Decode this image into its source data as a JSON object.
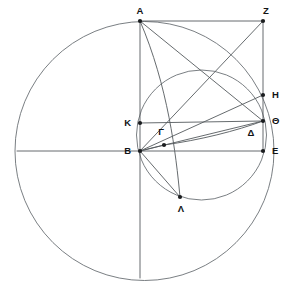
{
  "figure": {
    "background_color": "#ffffff",
    "line_color": "#555a5e",
    "circle_color": "#6b7075",
    "label_color": "#111315",
    "dot_color": "#1b1d1f",
    "width": 289,
    "height": 288
  },
  "points": [
    {
      "label": "A",
      "x": 140,
      "y": 21,
      "label_x": 140,
      "label_y": 11,
      "anchor": "middle",
      "dot": true
    },
    {
      "label": "Z",
      "x": 263,
      "y": 21,
      "label_x": 266,
      "label_y": 11,
      "anchor": "middle",
      "dot": true
    },
    {
      "label": "H",
      "x": 263,
      "y": 95,
      "label_x": 272,
      "label_y": 95,
      "anchor": "start",
      "dot": true
    },
    {
      "label": "Θ",
      "x": 263,
      "y": 121,
      "label_x": 272,
      "label_y": 121,
      "anchor": "start",
      "dot": true
    },
    {
      "label": "E",
      "x": 263,
      "y": 151,
      "label_x": 272,
      "label_y": 151,
      "anchor": "start",
      "dot": true
    },
    {
      "label": "Δ",
      "x": 258,
      "y": 140,
      "label_x": 251,
      "label_y": 133,
      "anchor": "middle",
      "dot": false
    },
    {
      "label": "K",
      "x": 140,
      "y": 123,
      "label_x": 131,
      "label_y": 123,
      "anchor": "end",
      "dot": true
    },
    {
      "label": "B",
      "x": 140,
      "y": 151,
      "label_x": 131,
      "label_y": 151,
      "anchor": "end",
      "dot": true
    },
    {
      "label": "Γ",
      "x": 164,
      "y": 145,
      "label_x": 161,
      "label_y": 132,
      "anchor": "middle",
      "dot": true
    },
    {
      "label": "Λ",
      "x": 180,
      "y": 197,
      "label_x": 181,
      "label_y": 209,
      "anchor": "middle",
      "dot": true
    }
  ],
  "circles": [
    {
      "name": "outer-circle",
      "cx": 144.5,
      "cy": 151,
      "r": 129.5
    },
    {
      "name": "inner-circle",
      "cx": 201.5,
      "cy": 135,
      "r": 65
    }
  ],
  "segments": [
    {
      "name": "segment-A-Z",
      "x1": 140,
      "y1": 21,
      "x2": 263,
      "y2": 21
    },
    {
      "name": "segment-A-B",
      "x1": 140,
      "y1": 21,
      "x2": 140,
      "y2": 151
    },
    {
      "name": "segment-A-theta",
      "x1": 140,
      "y1": 21,
      "x2": 263,
      "y2": 121
    },
    {
      "name": "segment-Z-E",
      "x1": 263,
      "y1": 21,
      "x2": 263,
      "y2": 151
    },
    {
      "name": "segment-Z-B",
      "x1": 263,
      "y1": 21,
      "x2": 140,
      "y2": 151
    },
    {
      "name": "segment-B-H",
      "x1": 140,
      "y1": 151,
      "x2": 263,
      "y2": 95
    },
    {
      "name": "segment-B-theta",
      "x1": 140,
      "y1": 151,
      "x2": 263,
      "y2": 121
    },
    {
      "name": "segment-B-E",
      "x1": 140,
      "y1": 151,
      "x2": 263,
      "y2": 151
    },
    {
      "name": "segment-K-theta",
      "x1": 140,
      "y1": 123,
      "x2": 263,
      "y2": 121
    },
    {
      "name": "segment-B-gamma",
      "x1": 140,
      "y1": 151,
      "x2": 164,
      "y2": 145
    },
    {
      "name": "segment-B-lambda",
      "x1": 140,
      "y1": 151,
      "x2": 180,
      "y2": 197
    },
    {
      "name": "diameter-left",
      "x1": 17,
      "y1": 151,
      "x2": 140,
      "y2": 151
    },
    {
      "name": "axis-vertical-lower",
      "x1": 140,
      "y1": 151,
      "x2": 140,
      "y2": 278
    }
  ],
  "arcs": [
    {
      "name": "arc-A-lambda",
      "d": "M 140 21 C 168 86 176 154 180 197"
    },
    {
      "name": "arc-gamma-theta",
      "d": "M 164 145 C 200 140 236 131 263 121"
    }
  ]
}
